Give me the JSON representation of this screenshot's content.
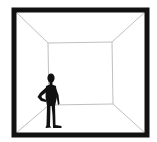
{
  "figure": {
    "colors": {
      "background": "#ffffff",
      "frame": "#111111",
      "lines": "#b8b8b8",
      "silhouette": "#111111"
    },
    "outer_frame": {
      "x1": 14,
      "y1": 10,
      "x2": 147,
      "y2": 135,
      "stroke_width": 5
    },
    "back_wall": {
      "x1": 48,
      "y1": 43,
      "x2": 112,
      "y2": 105
    },
    "elements": [
      "outer-frame",
      "back-wall",
      "perspective-edges",
      "human-silhouette"
    ]
  }
}
